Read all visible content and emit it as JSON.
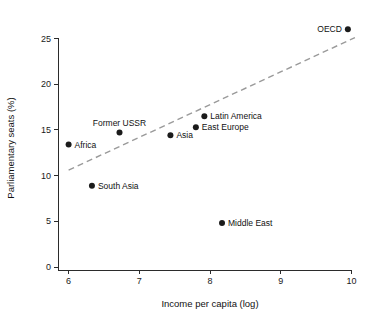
{
  "chart_data": {
    "type": "scatter",
    "title": "",
    "xlabel": "Income per capita (log)",
    "ylabel": "Parliamentary seats (%)",
    "xlim": [
      5.85,
      10.15
    ],
    "ylim": [
      0,
      26.8
    ],
    "xticks": [
      "6",
      "7",
      "8",
      "9",
      "10"
    ],
    "xtick_values": [
      6,
      7,
      8,
      9,
      10
    ],
    "yticks": [
      "0",
      "5",
      "10",
      "15",
      "20",
      "25"
    ],
    "ytick_values": [
      0,
      5,
      10,
      15,
      20,
      25
    ],
    "grid": false,
    "legend": "none",
    "marker_color": "#1b1b1b",
    "trend_color": "#9a9a9a",
    "points": [
      {
        "label": "Africa",
        "x": 6.0,
        "y": 13.4,
        "label_pos": "right"
      },
      {
        "label": "South Asia",
        "x": 6.33,
        "y": 8.9,
        "label_pos": "right"
      },
      {
        "label": "Former USSR",
        "x": 6.72,
        "y": 14.7,
        "label_pos": "above"
      },
      {
        "label": "Asia",
        "x": 7.44,
        "y": 14.4,
        "label_pos": "right"
      },
      {
        "label": "East Europe",
        "x": 7.8,
        "y": 15.3,
        "label_pos": "right"
      },
      {
        "label": "Latin America",
        "x": 7.92,
        "y": 16.5,
        "label_pos": "right"
      },
      {
        "label": "Middle East",
        "x": 8.17,
        "y": 4.8,
        "label_pos": "right"
      },
      {
        "label": "OECD",
        "x": 9.95,
        "y": 26.0,
        "label_pos": "left"
      }
    ],
    "trend": {
      "style": "dashed",
      "x0": 6.0,
      "y0": 10.6,
      "x1": 10.05,
      "y1": 25.1
    }
  }
}
